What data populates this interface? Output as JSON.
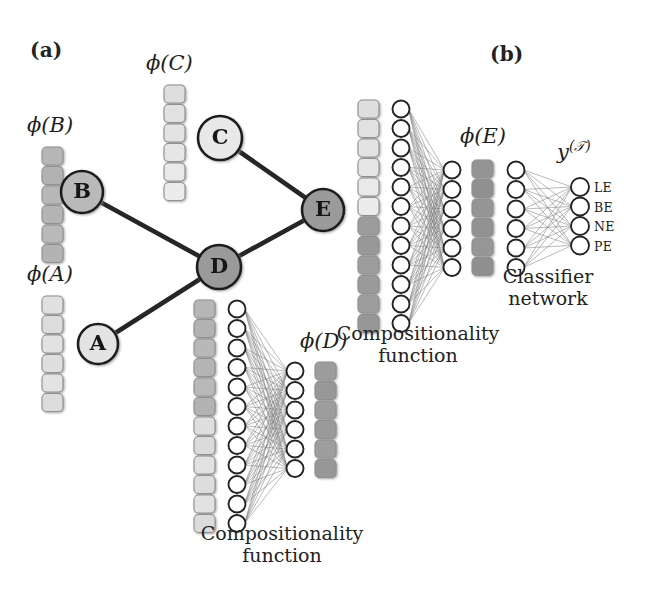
{
  "figure": {
    "width": 647,
    "height": 604,
    "background": "#ffffff",
    "type": "recursive-neural-network-diagram"
  },
  "panels": {
    "a": {
      "label": "(a)",
      "x": 30,
      "y": 38
    },
    "b": {
      "label": "(b)",
      "x": 490,
      "y": 42
    }
  },
  "palette": {
    "very_light": "#e6e6e6",
    "light": "#d4d4d4",
    "medium_light": "#c2c2c2",
    "medium": "#b0b0b0",
    "medium_dark": "#a0a0a0",
    "dark": "#8c8c8c",
    "node_stroke": "#2b2b2b",
    "edge": "#262626",
    "thin_edge": "#7a7a7a",
    "text": "#1b1b1b",
    "circle_fill": "#ffffff"
  },
  "tree": {
    "name": "parse-tree",
    "nodes": [
      {
        "id": "A",
        "label": "A",
        "cx": 98,
        "cy": 344,
        "r": 20,
        "fill": "#e3e3e3"
      },
      {
        "id": "B",
        "label": "B",
        "cx": 82,
        "cy": 192,
        "r": 21,
        "fill": "#b9b9b9"
      },
      {
        "id": "C",
        "label": "C",
        "cx": 220,
        "cy": 138,
        "r": 22,
        "fill": "#e8e8e8"
      },
      {
        "id": "D",
        "label": "D",
        "cx": 219,
        "cy": 267,
        "r": 22,
        "fill": "#9a9a9a"
      },
      {
        "id": "E",
        "label": "E",
        "cx": 323,
        "cy": 210,
        "r": 21,
        "fill": "#9a9a9a"
      }
    ],
    "edges": [
      {
        "from": "B",
        "to": "D"
      },
      {
        "from": "A",
        "to": "D"
      },
      {
        "from": "D",
        "to": "E"
      },
      {
        "from": "C",
        "to": "E"
      }
    ]
  },
  "vectors": [
    {
      "name": "phi-A-vector",
      "label": "ϕ(A)",
      "label_base": "ϕ",
      "label_arg": "A",
      "label_x": 27,
      "label_y": 267,
      "x": 42,
      "y": 296,
      "cell_w": 21,
      "cell_h": 18,
      "gap": 1.5,
      "cells": [
        "#e0e0e0",
        "#dcdcdc",
        "#e2e2e2",
        "#dedede",
        "#e3e3e3",
        "#dcdcdc"
      ]
    },
    {
      "name": "phi-B-vector",
      "label": "ϕ(B)",
      "label_base": "ϕ",
      "label_arg": "B",
      "label_x": 27,
      "label_y": 118,
      "x": 42,
      "y": 147,
      "cell_w": 21,
      "cell_h": 18,
      "gap": 1.5,
      "cells": [
        "#b6b6b6",
        "#b2b2b2",
        "#b8b8b8",
        "#b4b4b4",
        "#b9b9b9",
        "#b3b3b3"
      ]
    },
    {
      "name": "phi-C-vector",
      "label": "ϕ(C)",
      "label_base": "ϕ",
      "label_arg": "C",
      "label_x": 146,
      "label_y": 56,
      "x": 164,
      "y": 85,
      "cell_w": 21,
      "cell_h": 18,
      "gap": 1.5,
      "cells": [
        "#dedede",
        "#e1e1e1",
        "#e3e3e3",
        "#e6e6e6",
        "#e9e9e9",
        "#ececec"
      ]
    },
    {
      "name": "phi-D-vector",
      "label": "ϕ(D)",
      "label_base": "ϕ",
      "label_arg": "D",
      "label_x": 300,
      "label_y": 334,
      "x": 315,
      "y": 362,
      "cell_w": 21,
      "cell_h": 18,
      "gap": 1.5,
      "cells": [
        "#9c9c9c",
        "#989898",
        "#9d9d9d",
        "#9a9a9a",
        "#9e9e9e",
        "#979797"
      ]
    },
    {
      "name": "phi-E-vector",
      "label": "ϕ(E)",
      "label_base": "ϕ",
      "label_arg": "E",
      "label_x": 460,
      "label_y": 129,
      "x": 472,
      "y": 160,
      "cell_w": 21,
      "cell_h": 18,
      "gap": 1.5,
      "cells": [
        "#949494",
        "#909090",
        "#959595",
        "#929292",
        "#969696",
        "#8f8f8f"
      ]
    }
  ],
  "networks": [
    {
      "name": "composition-network-D",
      "caption_line1": "Compositionality",
      "caption_line2": "function",
      "caption_x": 282,
      "caption_y": 522,
      "input_vector": {
        "name": "input-stack-BA",
        "x": 194,
        "y": 300,
        "cell_w": 21,
        "cell_h": 18,
        "gap": 1.5,
        "cells": [
          "#b6b6b6",
          "#b2b2b2",
          "#b8b8b8",
          "#b4b4b4",
          "#b9b9b9",
          "#b3b3b3",
          "#dfdfdf",
          "#dbdbdb",
          "#e1e1e1",
          "#dddddd",
          "#e2e2e2",
          "#dbdbdb"
        ]
      },
      "input_layer": {
        "name": "input-units",
        "count": 12,
        "x": 237,
        "y_start": 309,
        "spacing": 19.5,
        "r": 8.5
      },
      "output_layer": {
        "name": "output-units",
        "count": 6,
        "x": 295,
        "y_start": 371,
        "spacing": 19.5,
        "r": 8.5
      }
    },
    {
      "name": "composition-network-E",
      "caption_line1": "Compositionality",
      "caption_line2": "function",
      "caption_x": 418,
      "caption_y": 322,
      "input_vector": {
        "name": "input-stack-CD",
        "x": 358,
        "y": 100,
        "cell_w": 21,
        "cell_h": 18,
        "gap": 1.5,
        "cells": [
          "#dedede",
          "#e1e1e1",
          "#e3e3e3",
          "#e6e6e6",
          "#e9e9e9",
          "#ececec",
          "#9c9c9c",
          "#989898",
          "#9d9d9d",
          "#9a9a9a",
          "#9e9e9e",
          "#979797"
        ]
      },
      "input_layer": {
        "name": "input-units",
        "count": 12,
        "x": 401,
        "y_start": 109,
        "spacing": 19.5,
        "r": 8.5
      },
      "output_layer": {
        "name": "output-units",
        "count": 6,
        "x": 452,
        "y_start": 170,
        "spacing": 19.5,
        "r": 8.5
      }
    },
    {
      "name": "classifier-network",
      "caption_line1": "Classifier",
      "caption_line2": "network",
      "caption_x": 548,
      "caption_y": 265,
      "input_layer": {
        "name": "classifier-input-units",
        "count": 6,
        "x": 516,
        "y_start": 170,
        "spacing": 19.5,
        "r": 8.5
      },
      "output_layer": {
        "name": "classifier-output-units",
        "count": 4,
        "x": 580,
        "y_start": 187,
        "spacing": 19.5,
        "r": 9
      },
      "output_label": {
        "base": "y",
        "sup": "(𝒯)",
        "text": "y(𝒯)",
        "x": 560,
        "y": 145
      },
      "output_classes": [
        "LE",
        "BE",
        "NE",
        "PE"
      ]
    }
  ]
}
